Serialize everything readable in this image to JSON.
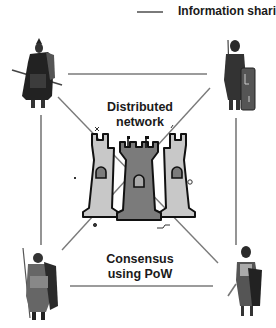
{
  "legend": {
    "line_label": "Information sharing",
    "line_color": "#7a7a7a"
  },
  "labels": {
    "top": [
      "Distributed",
      "network"
    ],
    "bottom": [
      "Consensus",
      "using PoW"
    ]
  },
  "nodes": [
    {
      "position": "top-left",
      "figure": "warrior-with-spear-and-cloak"
    },
    {
      "position": "top-right",
      "figure": "roman-soldier-with-shield"
    },
    {
      "position": "bottom-left",
      "figure": "soldier-with-spear-and-shield"
    },
    {
      "position": "bottom-right",
      "figure": "roman-soldier-with-sword"
    }
  ],
  "center": {
    "figure": "castle-towers-icon"
  },
  "colors": {
    "line": "#7a7a7a",
    "tower_light": "#c8c8c8",
    "tower_dark": "#7b7b7b",
    "outline": "#111111",
    "text": "#1a1a1a"
  }
}
